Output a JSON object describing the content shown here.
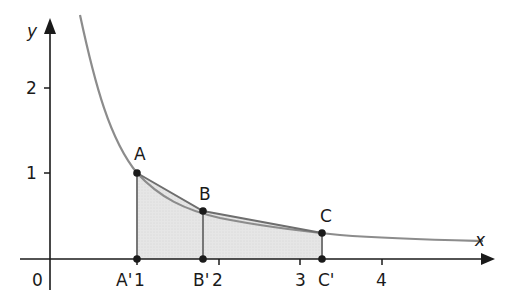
{
  "diagram": {
    "function": "y = 1/x",
    "axes": {
      "x_label": "x",
      "y_label": "y",
      "origin_label": "0",
      "x_ticks": [
        "1",
        "2",
        "3",
        "4"
      ],
      "y_ticks": [
        "1",
        "2"
      ]
    },
    "points": [
      {
        "name": "A",
        "x": 1.0,
        "y": 1.0
      },
      {
        "name": "B",
        "x": 1.8,
        "y": 0.556
      },
      {
        "name": "C",
        "x": 3.27,
        "y": 0.306
      }
    ],
    "projections": [
      {
        "name": "A'",
        "x": 1.0
      },
      {
        "name": "B'",
        "x": 1.8
      },
      {
        "name": "C'",
        "x": 3.27
      }
    ],
    "colors": {
      "curve": "#8c8c8c",
      "shade": "#e3e3e3",
      "axis": "#1a1a1a",
      "chord": "#6e6e6e"
    }
  }
}
